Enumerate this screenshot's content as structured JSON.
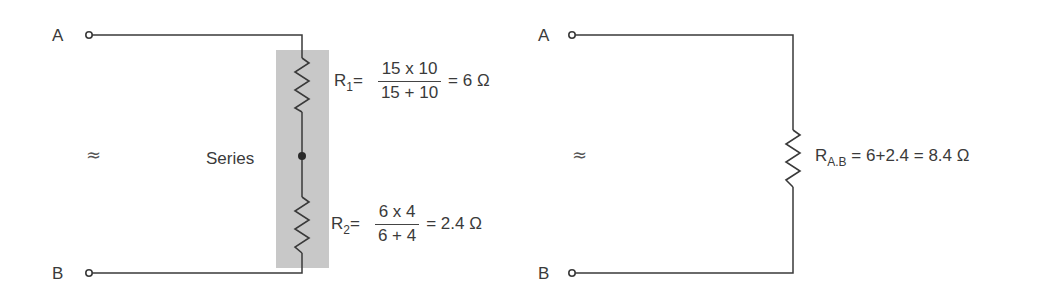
{
  "left_circuit": {
    "terminal_a": "A",
    "terminal_b": "B",
    "approx_symbol": "≈",
    "group_label": "Series",
    "r1": {
      "name": "R",
      "sub": "1",
      "eq": "=",
      "numerator": "15 x 10",
      "denominator": "15 + 10",
      "result": "= 6 Ω"
    },
    "r2": {
      "name": "R",
      "sub": "2",
      "eq": "=",
      "numerator": "6 x 4",
      "denominator": "6 + 4",
      "result": "= 2.4 Ω"
    }
  },
  "right_circuit": {
    "terminal_a": "A",
    "terminal_b": "B",
    "approx_symbol": "≈",
    "rab": {
      "name": "R",
      "sub": "A.B",
      "expression": " = 6+2.4 = 8.4 Ω"
    }
  },
  "colors": {
    "wire": "#3a3a3a",
    "series_shade": "#c8c8c8"
  }
}
